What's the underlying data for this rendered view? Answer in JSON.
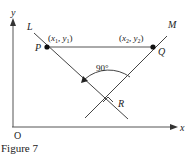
{
  "figure": {
    "caption": "Figure 7",
    "axes": {
      "x_label": "x",
      "y_label": "y",
      "origin_label": "O"
    },
    "lines": [
      {
        "name": "L",
        "label": "L"
      },
      {
        "name": "M",
        "label": "M"
      }
    ],
    "points": {
      "P": {
        "label": "P",
        "coords": "(x1, y1)",
        "coord_x": "x",
        "coord_x_sub": "1",
        "coord_y": "y",
        "coord_y_sub": "1"
      },
      "Q": {
        "label": "Q",
        "coords": "(x2, y2)",
        "coord_x": "x",
        "coord_x_sub": "2",
        "coord_y": "y",
        "coord_y_sub": "2"
      },
      "R": {
        "label": "R"
      }
    },
    "angle_label": "90°"
  }
}
